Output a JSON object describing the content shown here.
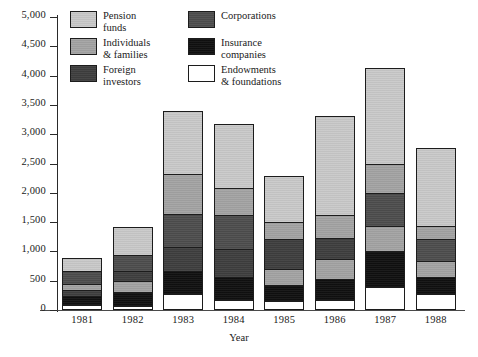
{
  "chart_data": {
    "type": "bar",
    "stacked": true,
    "title": "",
    "xlabel": "Year",
    "ylabel": "",
    "ylim": [
      0,
      5000
    ],
    "yticks": [
      "0",
      "500",
      "1,000",
      "1,500",
      "2,000",
      "2,500",
      "3,000",
      "3,500",
      "4,000",
      "4,500",
      "5,000"
    ],
    "ytick_values": [
      0,
      500,
      1000,
      1500,
      2000,
      2500,
      3000,
      3500,
      4000,
      4500,
      5000
    ],
    "grid": false,
    "legend_position": "top-left-inside",
    "categories": [
      "1981",
      "1982",
      "1983",
      "1984",
      "1985",
      "1986",
      "1987",
      "1988"
    ],
    "series": [
      {
        "name": "Endowments\n& foundations",
        "key": "endowments",
        "color": "#ffffff",
        "values": [
          70,
          60,
          250,
          150,
          130,
          160,
          370,
          260
        ]
      },
      {
        "name": "Insurance\ncompanies",
        "key": "insurance",
        "color": "#101010",
        "values": [
          160,
          230,
          400,
          410,
          290,
          350,
          630,
          300
        ]
      },
      {
        "name": "Foreign\ninvestors",
        "key": "foreign",
        "color": "#3e3e3e",
        "values": [
          110,
          180,
          410,
          470,
          790,
          710,
          440,
          260
        ]
      },
      {
        "name": "Individuals\n& families",
        "key": "individuals",
        "color": "#a3a3a3",
        "values": [
          110,
          200,
          550,
          600,
          300,
          390,
          560,
          380
        ]
      },
      {
        "name": "Corporations",
        "key": "corporations",
        "color": "#4d4d4d",
        "values": [
          220,
          270,
          700,
          450,
          0,
          0,
          700,
          250
        ]
      },
      {
        "name": "Pension\nfunds",
        "key": "pension",
        "color": "#c9c9c9",
        "values": [
          210,
          480,
          1090,
          1090,
          770,
          1700,
          1430,
          1320
        ]
      }
    ],
    "totals": [
      880,
      1420,
      3400,
      3170,
      2280,
      3310,
      4130,
      2770
    ],
    "bars": [
      {
        "year": "1981",
        "total": 880,
        "segments": [
          {
            "key": "pension",
            "label": "Pension funds",
            "from": 670,
            "to": 880,
            "value": 210
          },
          {
            "key": "corporations",
            "label": "Corporations",
            "from": 450,
            "to": 670,
            "value": 220
          },
          {
            "key": "individuals",
            "label": "Individuals & families",
            "from": 340,
            "to": 450,
            "value": 110
          },
          {
            "key": "foreign",
            "label": "Foreign investors",
            "from": 230,
            "to": 340,
            "value": 110
          },
          {
            "key": "insurance",
            "label": "Insurance companies",
            "from": 70,
            "to": 230,
            "value": 160
          },
          {
            "key": "endowments",
            "label": "Endowments & foundations",
            "from": 0,
            "to": 70,
            "value": 70
          }
        ]
      },
      {
        "year": "1982",
        "total": 1420,
        "segments": [
          {
            "key": "pension",
            "label": "Pension funds",
            "from": 940,
            "to": 1420,
            "value": 480
          },
          {
            "key": "corporations",
            "label": "Corporations",
            "from": 670,
            "to": 940,
            "value": 270
          },
          {
            "key": "foreign",
            "label": "Foreign investors",
            "from": 490,
            "to": 670,
            "value": 180
          },
          {
            "key": "individuals",
            "label": "Individuals & families",
            "from": 290,
            "to": 490,
            "value": 200
          },
          {
            "key": "insurance",
            "label": "Insurance companies",
            "from": 60,
            "to": 290,
            "value": 230
          },
          {
            "key": "endowments",
            "label": "Endowments & foundations",
            "from": 0,
            "to": 60,
            "value": 60
          }
        ]
      },
      {
        "year": "1983",
        "total": 3400,
        "segments": [
          {
            "key": "pension",
            "label": "Pension funds",
            "from": 2320,
            "to": 3400,
            "value": 1080
          },
          {
            "key": "individuals",
            "label": "Individuals & families",
            "from": 1630,
            "to": 2320,
            "value": 690
          },
          {
            "key": "corporations",
            "label": "Corporations",
            "from": 1060,
            "to": 1630,
            "value": 570
          },
          {
            "key": "foreign",
            "label": "Foreign investors",
            "from": 650,
            "to": 1060,
            "value": 410
          },
          {
            "key": "insurance",
            "label": "Insurance companies",
            "from": 250,
            "to": 650,
            "value": 400
          },
          {
            "key": "endowments",
            "label": "Endowments & foundations",
            "from": 0,
            "to": 250,
            "value": 250
          }
        ]
      },
      {
        "year": "1984",
        "total": 3170,
        "segments": [
          {
            "key": "pension",
            "label": "Pension funds",
            "from": 2080,
            "to": 3170,
            "value": 1090
          },
          {
            "key": "individuals",
            "label": "Individuals & families",
            "from": 1620,
            "to": 2080,
            "value": 460
          },
          {
            "key": "corporations",
            "label": "Corporations",
            "from": 1030,
            "to": 1620,
            "value": 590
          },
          {
            "key": "foreign",
            "label": "Foreign investors",
            "from": 560,
            "to": 1030,
            "value": 470
          },
          {
            "key": "insurance",
            "label": "Insurance companies",
            "from": 150,
            "to": 560,
            "value": 410
          },
          {
            "key": "endowments",
            "label": "Endowments & foundations",
            "from": 0,
            "to": 150,
            "value": 150
          }
        ]
      },
      {
        "year": "1985",
        "total": 2280,
        "segments": [
          {
            "key": "pension",
            "label": "Pension funds",
            "from": 1510,
            "to": 2280,
            "value": 770
          },
          {
            "key": "individuals",
            "label": "Individuals & families",
            "from": 1210,
            "to": 1510,
            "value": 300
          },
          {
            "key": "foreign",
            "label": "Foreign investors",
            "from": 700,
            "to": 1210,
            "value": 510
          },
          {
            "key": "individuals2",
            "label": "Individuals & families",
            "from": 420,
            "to": 700,
            "value": 280
          },
          {
            "key": "insurance",
            "label": "Insurance companies",
            "from": 130,
            "to": 420,
            "value": 290
          },
          {
            "key": "endowments",
            "label": "Endowments & foundations",
            "from": 0,
            "to": 130,
            "value": 130
          }
        ]
      },
      {
        "year": "1986",
        "total": 3310,
        "segments": [
          {
            "key": "pension",
            "label": "Pension funds",
            "from": 1620,
            "to": 3310,
            "value": 1690
          },
          {
            "key": "individuals",
            "label": "Individuals & families",
            "from": 1220,
            "to": 1620,
            "value": 400
          },
          {
            "key": "foreign",
            "label": "Foreign investors",
            "from": 870,
            "to": 1220,
            "value": 350
          },
          {
            "key": "individuals2",
            "label": "Individuals & families",
            "from": 510,
            "to": 870,
            "value": 360
          },
          {
            "key": "insurance",
            "label": "Insurance companies",
            "from": 160,
            "to": 510,
            "value": 350
          },
          {
            "key": "endowments",
            "label": "Endowments & foundations",
            "from": 0,
            "to": 160,
            "value": 160
          }
        ]
      },
      {
        "year": "1987",
        "total": 4130,
        "segments": [
          {
            "key": "pension",
            "label": "Pension funds",
            "from": 2500,
            "to": 4130,
            "value": 1630
          },
          {
            "key": "individuals",
            "label": "Individuals & families",
            "from": 1990,
            "to": 2500,
            "value": 510
          },
          {
            "key": "corporations",
            "label": "Corporations",
            "from": 1430,
            "to": 1990,
            "value": 560
          },
          {
            "key": "individuals2",
            "label": "Individuals & families",
            "from": 1000,
            "to": 1430,
            "value": 430
          },
          {
            "key": "insurance",
            "label": "Insurance companies",
            "from": 370,
            "to": 1000,
            "value": 630
          },
          {
            "key": "endowments",
            "label": "Endowments & foundations",
            "from": 0,
            "to": 370,
            "value": 370
          }
        ]
      },
      {
        "year": "1988",
        "total": 2770,
        "segments": [
          {
            "key": "pension",
            "label": "Pension funds",
            "from": 1440,
            "to": 2770,
            "value": 1330
          },
          {
            "key": "individuals",
            "label": "Individuals & families",
            "from": 1210,
            "to": 1440,
            "value": 230
          },
          {
            "key": "corporations",
            "label": "Corporations",
            "from": 830,
            "to": 1210,
            "value": 380
          },
          {
            "key": "individuals2",
            "label": "Individuals & families",
            "from": 560,
            "to": 830,
            "value": 270
          },
          {
            "key": "insurance",
            "label": "Insurance companies",
            "from": 260,
            "to": 560,
            "value": 300
          },
          {
            "key": "endowments",
            "label": "Endowments & foundations",
            "from": 0,
            "to": 260,
            "value": 260
          }
        ]
      }
    ],
    "legend": [
      {
        "label": "Pension\nfunds",
        "key": "pension",
        "color": "#c9c9c9"
      },
      {
        "label": "Corporations",
        "key": "corporations",
        "color": "#4d4d4d"
      },
      {
        "label": "Individuals\n& families",
        "key": "individuals",
        "color": "#a3a3a3"
      },
      {
        "label": "Insurance\ncompanies",
        "key": "insurance",
        "color": "#101010"
      },
      {
        "label": "Foreign\ninvestors",
        "key": "foreign",
        "color": "#3e3e3e"
      },
      {
        "label": "Endowments\n& foundations",
        "key": "endowments",
        "color": "#ffffff"
      }
    ]
  }
}
